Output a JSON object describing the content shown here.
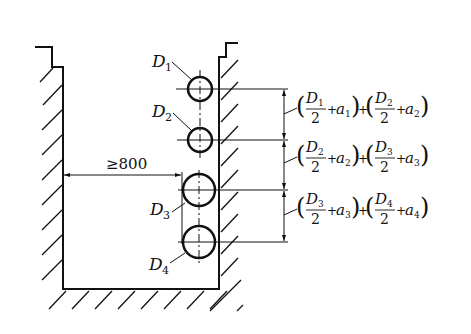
{
  "diagram": {
    "type": "pipe arrangement in trench section",
    "colors": {
      "line": "#111111",
      "background": "#ffffff"
    },
    "pipes": [
      {
        "label": "D",
        "sub": "1",
        "cx": 200,
        "cy": 89,
        "r": 12
      },
      {
        "label": "D",
        "sub": "2",
        "cx": 200,
        "cy": 140,
        "r": 12
      },
      {
        "label": "D",
        "sub": "3",
        "cx": 199,
        "cy": 190,
        "r": 16
      },
      {
        "label": "D",
        "sub": "4",
        "cx": 199,
        "cy": 242,
        "r": 16
      }
    ],
    "clearance": {
      "label": "≥800"
    },
    "spacings": [
      {
        "pipe_a": "1",
        "pipe_b": "2",
        "d_a": "D",
        "d_b": "D",
        "sub_a": "1",
        "sub_b": "2",
        "den": "2",
        "plus": "+",
        "a": "a",
        "sa": "1",
        "sb": "2",
        "lp": "(",
        "rp": ")"
      },
      {
        "pipe_a": "2",
        "pipe_b": "3",
        "d_a": "D",
        "d_b": "D",
        "sub_a": "2",
        "sub_b": "3",
        "den": "2",
        "plus": "+",
        "a": "a",
        "sa": "2",
        "sb": "3",
        "lp": "(",
        "rp": ")"
      },
      {
        "pipe_a": "3",
        "pipe_b": "4",
        "d_a": "D",
        "d_b": "D",
        "sub_a": "3",
        "sub_b": "4",
        "den": "2",
        "plus": "+",
        "a": "a",
        "sa": "3",
        "sb": "4",
        "lp": "(",
        "rp": ")"
      }
    ]
  }
}
